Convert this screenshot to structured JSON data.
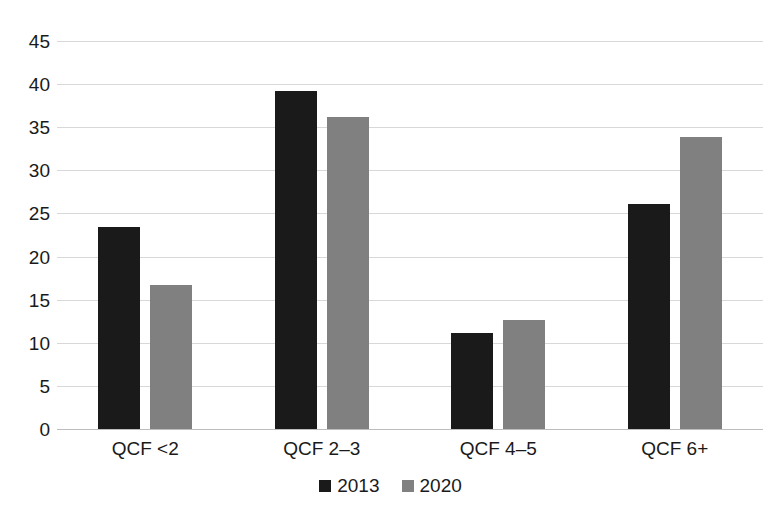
{
  "chart_data": {
    "type": "bar",
    "title": "",
    "subtitle": "",
    "xlabel": "",
    "ylabel": "",
    "categories": [
      "QCF <2",
      "QCF 2–3",
      "QCF 4–5",
      "QCF 6+"
    ],
    "series": [
      {
        "name": "2013",
        "color": "#1a1a1a",
        "values": [
          23.4,
          39.2,
          11.1,
          26.1
        ]
      },
      {
        "name": "2020",
        "color": "#808080",
        "values": [
          16.7,
          36.2,
          12.7,
          33.9
        ]
      }
    ],
    "ylim": [
      0,
      45
    ],
    "yticks": [
      0,
      5,
      10,
      15,
      20,
      25,
      30,
      35,
      40,
      45
    ],
    "ytick_labels": [
      "0",
      "5",
      "10",
      "15",
      "20",
      "25",
      "30",
      "35",
      "40",
      "45"
    ],
    "grid": true,
    "grid_color": "#d8d8d8",
    "legend_position": "bottom-center",
    "legend_entries": [
      "2013",
      "2020"
    ],
    "background_color": "#ffffff",
    "annotations": []
  }
}
